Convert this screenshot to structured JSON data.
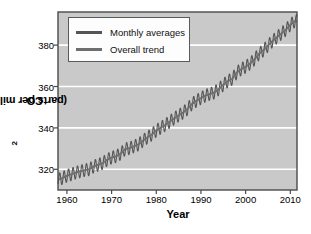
{
  "chart_data": {
    "type": "line",
    "title": "",
    "xlabel": "Year",
    "ylabel": "CO2 (parts per million)",
    "ylabel_main": "CO",
    "ylabel_sub": "2",
    "ylabel_rest": " (parts per million)",
    "xlim": [
      1958,
      2011.5
    ],
    "ylim": [
      310,
      396
    ],
    "xticks": [
      1960,
      1970,
      1980,
      1990,
      2000,
      2010
    ],
    "yticks": [
      320,
      340,
      360,
      380
    ],
    "grid": true,
    "grid_color": "#ffffff",
    "plot_bg": "#c9c9c9",
    "figure_bg": "#ffffff",
    "axis_color": "#4a4a4a",
    "legend_position": "upper-left",
    "series": [
      {
        "name": "Monthly averages",
        "color": "#555555",
        "style": "sawtooth",
        "seasonal_amplitude": 3.1,
        "description": "Mauna Loa monthly mean CO2 with seasonal oscillation"
      },
      {
        "name": "Overall trend",
        "color": "#6e6e6e",
        "style": "smooth",
        "description": "Smoothed long-term rising trend"
      }
    ],
    "x": [
      1958,
      1959,
      1960,
      1961,
      1962,
      1963,
      1964,
      1965,
      1966,
      1967,
      1968,
      1969,
      1970,
      1971,
      1972,
      1973,
      1974,
      1975,
      1976,
      1977,
      1978,
      1979,
      1980,
      1981,
      1982,
      1983,
      1984,
      1985,
      1986,
      1987,
      1988,
      1989,
      1990,
      1991,
      1992,
      1993,
      1994,
      1995,
      1996,
      1997,
      1998,
      1999,
      2000,
      2001,
      2002,
      2003,
      2004,
      2005,
      2006,
      2007,
      2008,
      2009,
      2010,
      2011
    ],
    "values": [
      315.0,
      315.8,
      316.9,
      317.6,
      318.4,
      319.0,
      319.6,
      320.0,
      321.4,
      322.2,
      323.0,
      324.6,
      325.7,
      326.3,
      327.5,
      329.7,
      330.2,
      331.1,
      332.0,
      333.8,
      335.4,
      336.8,
      338.7,
      340.1,
      341.4,
      343.0,
      344.6,
      346.0,
      347.4,
      349.2,
      351.6,
      353.1,
      354.4,
      355.6,
      356.4,
      357.1,
      358.8,
      360.8,
      362.6,
      363.7,
      366.7,
      368.4,
      369.5,
      371.1,
      373.2,
      375.8,
      377.5,
      379.8,
      381.9,
      383.8,
      385.6,
      387.4,
      389.8,
      391.6
    ]
  },
  "legend": {
    "items": [
      {
        "label": "Monthly averages"
      },
      {
        "label": "Overall trend"
      }
    ]
  }
}
